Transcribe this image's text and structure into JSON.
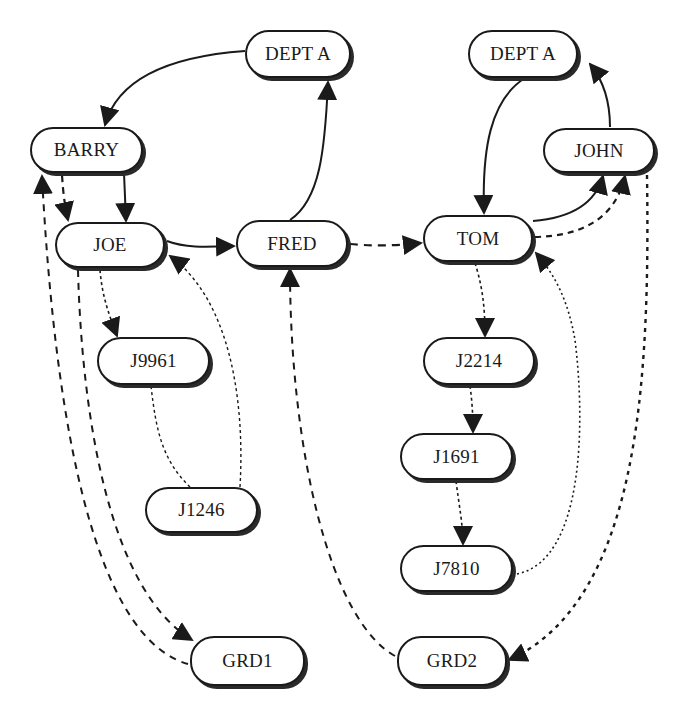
{
  "diagram": {
    "nodes": [
      {
        "id": "dept_a_left",
        "label": "DEPT A",
        "x": 245,
        "y": 30,
        "w": 106,
        "h": 48
      },
      {
        "id": "barry",
        "label": "BARRY",
        "x": 30,
        "y": 127,
        "w": 113,
        "h": 46
      },
      {
        "id": "joe",
        "label": "JOE",
        "x": 55,
        "y": 222,
        "w": 110,
        "h": 46
      },
      {
        "id": "fred",
        "label": "FRED",
        "x": 236,
        "y": 220,
        "w": 112,
        "h": 47
      },
      {
        "id": "dept_a_right",
        "label": "DEPT A",
        "x": 468,
        "y": 30,
        "w": 110,
        "h": 48
      },
      {
        "id": "john",
        "label": "JOHN",
        "x": 543,
        "y": 128,
        "w": 112,
        "h": 45
      },
      {
        "id": "tom",
        "label": "TOM",
        "x": 423,
        "y": 215,
        "w": 110,
        "h": 47
      },
      {
        "id": "j9961",
        "label": "J9961",
        "x": 97,
        "y": 337,
        "w": 113,
        "h": 48
      },
      {
        "id": "j2214",
        "label": "J2214",
        "x": 423,
        "y": 337,
        "w": 112,
        "h": 48
      },
      {
        "id": "j1246",
        "label": "J1246",
        "x": 145,
        "y": 487,
        "w": 113,
        "h": 46
      },
      {
        "id": "j1691",
        "label": "J1691",
        "x": 400,
        "y": 433,
        "w": 113,
        "h": 47
      },
      {
        "id": "j7810",
        "label": "J7810",
        "x": 400,
        "y": 545,
        "w": 113,
        "h": 47
      },
      {
        "id": "grd1",
        "label": "GRD1",
        "x": 190,
        "y": 636,
        "w": 115,
        "h": 50
      },
      {
        "id": "grd2",
        "label": "GRD2",
        "x": 397,
        "y": 636,
        "w": 110,
        "h": 50
      }
    ],
    "edges": [
      {
        "from": "dept_a_left",
        "to": "barry",
        "style": "solid"
      },
      {
        "from": "fred",
        "to": "dept_a_left",
        "style": "solid"
      },
      {
        "from": "barry",
        "to": "joe",
        "style": "solid"
      },
      {
        "from": "joe",
        "to": "fred",
        "style": "solid"
      },
      {
        "from": "barry",
        "to": "joe",
        "style": "dashed"
      },
      {
        "from": "fred",
        "to": "tom",
        "style": "dashed"
      },
      {
        "from": "dept_a_right",
        "to": "tom",
        "style": "solid"
      },
      {
        "from": "john",
        "to": "dept_a_right",
        "style": "solid"
      },
      {
        "from": "tom",
        "to": "john",
        "style": "solid"
      },
      {
        "from": "tom",
        "to": "john",
        "style": "dashed"
      },
      {
        "from": "joe",
        "to": "j9961",
        "style": "dotted"
      },
      {
        "from": "j9961",
        "to": "j1246",
        "style": "dotted"
      },
      {
        "from": "j1246",
        "to": "joe",
        "style": "dotted"
      },
      {
        "from": "tom",
        "to": "j2214",
        "style": "dotted"
      },
      {
        "from": "j2214",
        "to": "j1691",
        "style": "dotted"
      },
      {
        "from": "j1691",
        "to": "j7810",
        "style": "dotted"
      },
      {
        "from": "j7810",
        "to": "tom",
        "style": "dotted"
      },
      {
        "from": "joe",
        "to": "grd1",
        "style": "dashed"
      },
      {
        "from": "grd1",
        "to": "barry",
        "style": "dashed"
      },
      {
        "from": "grd2",
        "to": "fred",
        "style": "dashed"
      },
      {
        "from": "john",
        "to": "grd2",
        "style": "dashed"
      }
    ]
  }
}
